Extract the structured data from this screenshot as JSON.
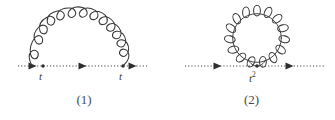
{
  "figure": {
    "background_color": "#ffffff",
    "stroke_color": "#3a3a3a",
    "caption_color": "#4a4a4a"
  },
  "diagrams": [
    {
      "id": "diagram-1",
      "caption": "(1)",
      "type": "self-energy",
      "propagator": {
        "style": "dotted",
        "x_start": 18,
        "x_end": 148,
        "y": 66,
        "arrow_positions": [
          33,
          83,
          133
        ]
      },
      "vertices": [
        {
          "label": "t",
          "x": 43,
          "y": 66
        },
        {
          "label": "t",
          "x": 123,
          "y": 66
        }
      ],
      "gluon": {
        "style": "coil-arc",
        "coils": 9,
        "x_left": 43,
        "x_right": 123,
        "apex_y": 14,
        "baseline_y": 66
      }
    },
    {
      "id": "diagram-2",
      "caption": "(2)",
      "type": "tadpole",
      "propagator": {
        "style": "dotted",
        "x_start": 185,
        "x_end": 325,
        "y": 66,
        "arrow_positions": [
          218,
          290
        ]
      },
      "vertices": [
        {
          "label": "t",
          "exponent": "2",
          "x": 257,
          "y": 66
        }
      ],
      "gluon": {
        "style": "coil-loop",
        "coils": 14,
        "center_x": 257,
        "center_y": 38,
        "radius": 27,
        "baseline_y": 66
      }
    }
  ],
  "labels": {
    "vertex_t_1": "t",
    "vertex_t_2": "t",
    "vertex_t_squared_base": "t",
    "vertex_t_squared_exponent": "2"
  }
}
